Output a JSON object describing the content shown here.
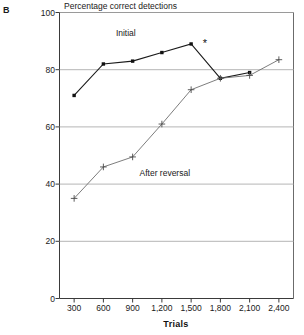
{
  "panel": {
    "label": "B"
  },
  "chart_data": {
    "type": "line",
    "title": "Percentage correct detections",
    "xlabel": "Trials",
    "ylabel": "",
    "categories": [
      "300",
      "600",
      "900",
      "1,200",
      "1,500",
      "1,800",
      "2,100",
      "2,400"
    ],
    "x": [
      300,
      600,
      900,
      1200,
      1500,
      1800,
      2100,
      2400
    ],
    "xlim": [
      150,
      2550
    ],
    "ylim": [
      0,
      100
    ],
    "yticks": [
      0,
      20,
      40,
      60,
      80,
      100
    ],
    "ytick_labels": [
      "0",
      "20",
      "40",
      "60",
      "80",
      "100"
    ],
    "grid": "horizontal",
    "legend": "inline-annotations",
    "series": [
      {
        "name": "Initial",
        "marker": "filled-square",
        "color": "#1a1a1a",
        "categories": [
          "300",
          "600",
          "900",
          "1,200",
          "1,500",
          "1,800",
          "2,100"
        ],
        "x": [
          300,
          600,
          900,
          1200,
          1500,
          1800,
          2100
        ],
        "values": [
          71,
          82,
          83,
          86,
          89,
          77,
          79
        ]
      },
      {
        "name": "After reversal",
        "marker": "plus",
        "color": "#6e6e6e",
        "categories": [
          "300",
          "600",
          "900",
          "1,200",
          "1,500",
          "1,800",
          "2,100",
          "2,400"
        ],
        "x": [
          300,
          600,
          900,
          1200,
          1500,
          1800,
          2100,
          2400
        ],
        "values": [
          35,
          46,
          49.5,
          61,
          73,
          77,
          78,
          83.5
        ]
      }
    ],
    "annotations": [
      {
        "text": "*",
        "x": 1620,
        "y": 91,
        "note": "significance marker beside Initial peak"
      }
    ],
    "series_labels": [
      {
        "text": "Initial",
        "x": 830,
        "y": 93
      },
      {
        "text": "After reversal",
        "x": 1230,
        "y": 44
      }
    ]
  }
}
